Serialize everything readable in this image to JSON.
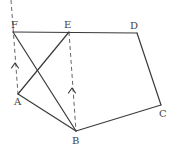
{
  "diagram": {
    "title": "",
    "points": [
      {
        "id": "F",
        "label": "F",
        "x": 13,
        "y": 32,
        "lx": 11,
        "ly": 28
      },
      {
        "id": "E",
        "label": "E",
        "x": 69,
        "y": 32,
        "lx": 64,
        "ly": 28
      },
      {
        "id": "D",
        "label": "D",
        "x": 137,
        "y": 33,
        "lx": 130,
        "ly": 29
      },
      {
        "id": "C",
        "label": "C",
        "x": 161,
        "y": 105,
        "lx": 159,
        "ly": 117
      },
      {
        "id": "B",
        "label": "B",
        "x": 76,
        "y": 131,
        "lx": 72,
        "ly": 144
      },
      {
        "id": "A",
        "label": "A",
        "x": 18,
        "y": 94,
        "lx": 14,
        "ly": 105
      }
    ],
    "segments": [
      {
        "from": "F",
        "to": "D",
        "style": "solid"
      },
      {
        "from": "D",
        "to": "C",
        "style": "solid"
      },
      {
        "from": "C",
        "to": "B",
        "style": "solid"
      },
      {
        "from": "B",
        "to": "A",
        "style": "solid"
      },
      {
        "from": "A",
        "to": "E",
        "style": "solid"
      },
      {
        "from": "F",
        "to": "B",
        "style": "solid"
      }
    ],
    "dashed_lines": [
      {
        "x1": 11,
        "y1": 0,
        "x2": 18,
        "y2": 94,
        "arrow": {
          "x": 15,
          "y": 63,
          "direction": "up"
        }
      },
      {
        "x1": 69,
        "y1": 32,
        "x2": 76,
        "y2": 131,
        "arrow": {
          "x": 72,
          "y": 88,
          "direction": "up"
        }
      }
    ],
    "colors": {
      "line": "#3a3a3a",
      "label": "#444444",
      "background": "#ffffff"
    }
  }
}
